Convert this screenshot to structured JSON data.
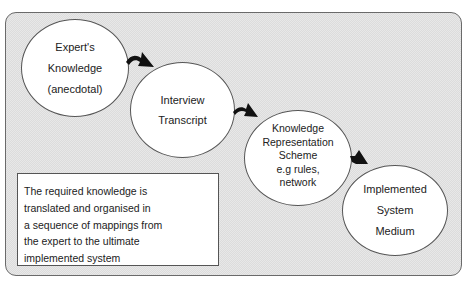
{
  "diagram": {
    "type": "process-flow",
    "nodes": [
      {
        "id": "expert",
        "lines": [
          "Expert's",
          "Knowledge",
          "(anecdotal)"
        ]
      },
      {
        "id": "interview",
        "lines": [
          "Interview",
          "Transcript"
        ]
      },
      {
        "id": "krs",
        "lines": [
          "Knowledge",
          "Representation",
          "Scheme",
          "e.g rules,",
          "network"
        ]
      },
      {
        "id": "implemented",
        "lines": [
          "Implemented",
          "System",
          "Medium"
        ]
      }
    ],
    "edges": [
      {
        "from": "expert",
        "to": "interview"
      },
      {
        "from": "interview",
        "to": "krs"
      },
      {
        "from": "krs",
        "to": "implemented"
      }
    ],
    "note": {
      "lines": [
        "The required knowledge is",
        "translated and organised in",
        "a sequence of mappings from",
        "the expert to the ultimate",
        "implemented system"
      ]
    }
  },
  "colors": {
    "background_pattern": "#dcdcdc",
    "node_fill": "#ffffff",
    "outline": "#555555",
    "arrow": "#111111"
  }
}
